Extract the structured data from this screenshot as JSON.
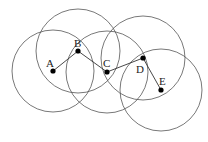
{
  "diagram": {
    "type": "network-coverage",
    "colors": {
      "circle": "#555555",
      "edge": "#333333",
      "node": "#000000",
      "label": "#222222"
    },
    "nodes": [
      {
        "id": "A",
        "label": "A",
        "x": 53,
        "y": 71,
        "r": 41,
        "lx": 46,
        "ly": 67
      },
      {
        "id": "B",
        "label": "B",
        "x": 78,
        "y": 51,
        "r": 42,
        "lx": 74,
        "ly": 47
      },
      {
        "id": "C",
        "label": "C",
        "x": 107,
        "y": 72,
        "r": 41,
        "lx": 103,
        "ly": 67
      },
      {
        "id": "D",
        "label": "D",
        "x": 143,
        "y": 58,
        "r": 42,
        "lx": 136,
        "ly": 73
      },
      {
        "id": "E",
        "label": "E",
        "x": 161,
        "y": 90,
        "r": 41,
        "lx": 159,
        "ly": 85
      }
    ],
    "edges": [
      [
        "A",
        "B"
      ],
      [
        "B",
        "C"
      ],
      [
        "C",
        "D"
      ],
      [
        "D",
        "E"
      ]
    ]
  }
}
